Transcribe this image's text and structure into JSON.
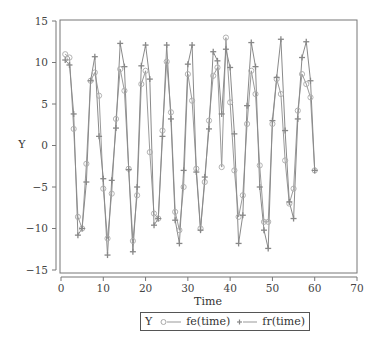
{
  "chart_data": {
    "type": "line",
    "title": "",
    "xlabel": "Time",
    "ylabel": "Y",
    "xlim": [
      0,
      70
    ],
    "ylim": [
      -15,
      15
    ],
    "x_ticks": [
      0,
      10,
      20,
      30,
      40,
      50,
      60,
      70
    ],
    "y_ticks": [
      -15,
      -10,
      -5,
      0,
      5,
      10,
      15
    ],
    "grid": false,
    "legend": {
      "title": "Y",
      "position": "bottom",
      "entries": [
        "fe(time)",
        "fr(time)"
      ]
    },
    "x": [
      1,
      2,
      3,
      4,
      5,
      6,
      7,
      8,
      9,
      10,
      11,
      12,
      13,
      14,
      15,
      16,
      17,
      18,
      19,
      20,
      21,
      22,
      23,
      24,
      25,
      26,
      27,
      28,
      29,
      30,
      31,
      32,
      33,
      34,
      35,
      36,
      37,
      38,
      39,
      40,
      41,
      42,
      43,
      44,
      45,
      46,
      47,
      48,
      49,
      50,
      51,
      52,
      53,
      54,
      55,
      56,
      57,
      58,
      59,
      60
    ],
    "series": [
      {
        "name": "fe(time)",
        "marker": "circle",
        "color": "#9a9a9a",
        "values": [
          11.0,
          10.6,
          2.0,
          -8.6,
          -10.0,
          -2.2,
          7.8,
          8.8,
          6.0,
          -5.2,
          -11.2,
          -5.8,
          3.2,
          9.2,
          6.6,
          -2.8,
          -11.5,
          -6.0,
          7.4,
          9.0,
          -0.8,
          -8.2,
          -8.8,
          1.8,
          10.1,
          4.0,
          -8.0,
          -10.2,
          -5.0,
          8.6,
          5.4,
          -2.8,
          -10.0,
          -4.4,
          3.0,
          8.4,
          9.4,
          -2.6,
          13.0,
          5.2,
          -3.0,
          -8.6,
          -6.0,
          2.6,
          9.0,
          6.2,
          -2.4,
          -9.2,
          -9.2,
          2.6,
          8.0,
          6.2,
          -1.8,
          -7.0,
          -5.2,
          4.2,
          8.6,
          7.4,
          5.8,
          -3.0
        ]
      },
      {
        "name": "fr(time)",
        "marker": "plus",
        "color": "#8a8a8a",
        "values": [
          10.3,
          9.7,
          3.8,
          -10.8,
          -10.0,
          -4.4,
          7.8,
          10.7,
          1.1,
          -4.0,
          -13.2,
          -4.2,
          2.1,
          12.3,
          9.5,
          -2.9,
          -12.8,
          -5.0,
          9.6,
          12.1,
          8.0,
          -9.6,
          -8.8,
          1.1,
          12.1,
          3.2,
          -9.0,
          -11.8,
          -3.0,
          9.8,
          12.1,
          -3.2,
          -10.2,
          -3.8,
          2.0,
          11.3,
          10.2,
          3.8,
          11.6,
          9.4,
          1.4,
          -11.8,
          -8.4,
          4.8,
          12.4,
          9.5,
          -5.0,
          -10.2,
          -12.4,
          3.0,
          8.2,
          12.8,
          1.8,
          -6.8,
          -8.8,
          3.2,
          10.6,
          12.5,
          7.8,
          -3.0
        ]
      }
    ]
  }
}
